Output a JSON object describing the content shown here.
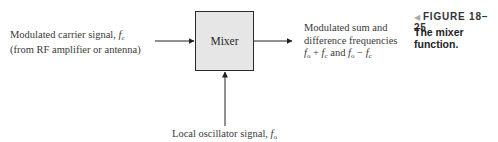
{
  "figure": {
    "number_label": "FIGURE 18–25",
    "caption": "The mixer function.",
    "marker_icon": "left-triangle"
  },
  "diagram": {
    "block": {
      "label": "Mixer",
      "fill": "#e6e6e6",
      "stroke": "#2a2a2a"
    },
    "input_left": {
      "line1_text": "Modulated carrier signal, ",
      "line1_symbol": "f",
      "line1_sub": "c",
      "line2_text": "(from RF amplifier or antenna)"
    },
    "input_bottom": {
      "text": "Local oscillator signal, ",
      "symbol": "f",
      "sub": "o"
    },
    "output_right": {
      "line1": "Modulated sum and",
      "line2": "difference frequencies",
      "line3_f1": "f",
      "line3_s1": "o",
      "line3_op1": " + ",
      "line3_f2": "f",
      "line3_s2": "c",
      "line3_and": " and ",
      "line3_f3": "f",
      "line3_s3": "o",
      "line3_op2": " − ",
      "line3_f4": "f",
      "line3_s4": "c"
    }
  }
}
